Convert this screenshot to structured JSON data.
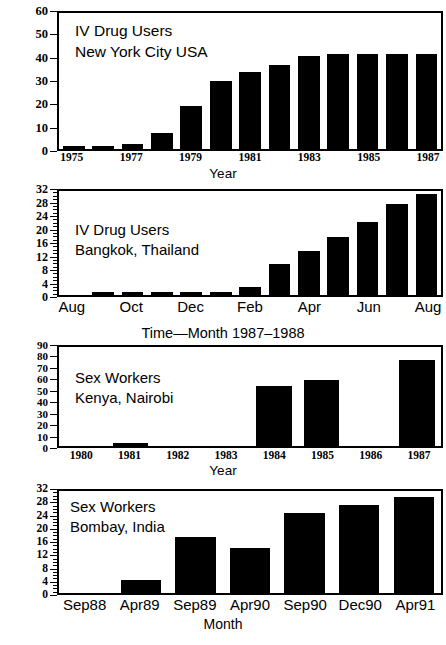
{
  "figure": {
    "background": "#ffffff",
    "ink_color": "#000000"
  },
  "chart_data": [
    {
      "id": "panel-1",
      "type": "bar",
      "title": "",
      "annotation_lines": [
        "IV Drug Users",
        "New York City USA"
      ],
      "population": "IV Drug Users",
      "location": "New York City USA",
      "xlabel": "Year",
      "ylabel": "",
      "ylim": [
        0,
        60
      ],
      "ytick_step": 10,
      "yticks": [
        0,
        10,
        20,
        30,
        40,
        50,
        60
      ],
      "ytick_labels": [
        "0",
        "10",
        "20",
        "30",
        "40",
        "50",
        "60"
      ],
      "grid": false,
      "legend": "none",
      "categories": [
        "1975",
        "1976",
        "1977",
        "1978",
        "1979",
        "1980",
        "1981",
        "1982",
        "1983",
        "1984",
        "1985",
        "1986",
        "1987"
      ],
      "xtick_labels_shown": [
        "1975",
        "",
        "1977",
        "",
        "1979",
        "",
        "1981",
        "",
        "1983",
        "",
        "1985",
        "",
        "1987"
      ],
      "values": [
        0.3,
        1.2,
        2.3,
        7,
        19,
        30,
        34,
        37,
        41,
        42,
        42,
        42,
        42
      ]
    },
    {
      "id": "panel-2",
      "type": "bar",
      "title": "",
      "annotation_lines": [
        "IV Drug Users",
        "Bangkok, Thailand"
      ],
      "population": "IV Drug Users",
      "location": "Bangkok, Thailand",
      "xlabel": "Time—Month 1987–1988",
      "ylabel": "",
      "ylim": [
        0,
        32
      ],
      "ytick_step": 4,
      "yticks": [
        0,
        4,
        8,
        12,
        16,
        20,
        24,
        28,
        32
      ],
      "ytick_labels": [
        "0",
        "4",
        "8",
        "12",
        "16",
        "20",
        "24",
        "28",
        "32"
      ],
      "grid": false,
      "legend": "none",
      "categories": [
        "Aug",
        "Sep",
        "Oct",
        "Nov",
        "Dec",
        "Jan",
        "Feb",
        "Mar",
        "Apr",
        "May",
        "Jun",
        "Jul",
        "Aug"
      ],
      "xtick_labels_shown": [
        "Aug",
        "",
        "Oct",
        "",
        "Dec",
        "",
        "Feb",
        "",
        "Apr",
        "",
        "Jun",
        "",
        "Aug"
      ],
      "values": [
        0,
        0.3,
        0.3,
        0.4,
        0.7,
        0.3,
        2.6,
        9.4,
        13.6,
        18,
        22.6,
        28,
        31
      ]
    },
    {
      "id": "panel-3",
      "type": "bar",
      "title": "",
      "annotation_lines": [
        "Sex Workers",
        "Kenya, Nairobi"
      ],
      "population": "Sex Workers",
      "location": "Kenya, Nairobi",
      "xlabel": "Year",
      "ylabel": "",
      "ylim": [
        0,
        90
      ],
      "ytick_step": 10,
      "yticks": [
        0,
        10,
        20,
        30,
        40,
        50,
        60,
        70,
        80,
        90
      ],
      "ytick_labels": [
        "0",
        "10",
        "20",
        "30",
        "40",
        "50",
        "60",
        "70",
        "80",
        "90"
      ],
      "grid": false,
      "legend": "none",
      "categories": [
        "1980",
        "1981",
        "1982",
        "1983",
        "1984",
        "1985",
        "1986",
        "1987"
      ],
      "xtick_labels_shown": [
        "1980",
        "1981",
        "1982",
        "1983",
        "1984",
        "1985",
        "1986",
        "1987"
      ],
      "values": [
        0,
        2,
        0,
        0,
        55,
        60,
        0,
        78
      ]
    },
    {
      "id": "panel-4",
      "type": "bar",
      "title": "",
      "annotation_lines": [
        "Sex Workers",
        "Bombay, India"
      ],
      "population": "Sex Workers",
      "location": "Bombay, India",
      "xlabel": "Month",
      "ylabel": "",
      "ylim": [
        0,
        32
      ],
      "ytick_step": 4,
      "yticks": [
        0,
        4,
        8,
        12,
        16,
        20,
        24,
        28,
        32
      ],
      "ytick_labels": [
        "0",
        "4",
        "8",
        "12",
        "16",
        "20",
        "24",
        "28",
        "32"
      ],
      "grid": false,
      "legend": "none",
      "categories": [
        "Sep88",
        "Apr89",
        "Sep89",
        "Apr90",
        "Sep90",
        "Dec90",
        "Apr91"
      ],
      "xtick_labels_shown": [
        "Sep88",
        "Apr89",
        "Sep89",
        "Apr90",
        "Sep90",
        "Dec90",
        "Apr91"
      ],
      "values": [
        0,
        4,
        17.5,
        14,
        25,
        27.5,
        30
      ]
    }
  ]
}
